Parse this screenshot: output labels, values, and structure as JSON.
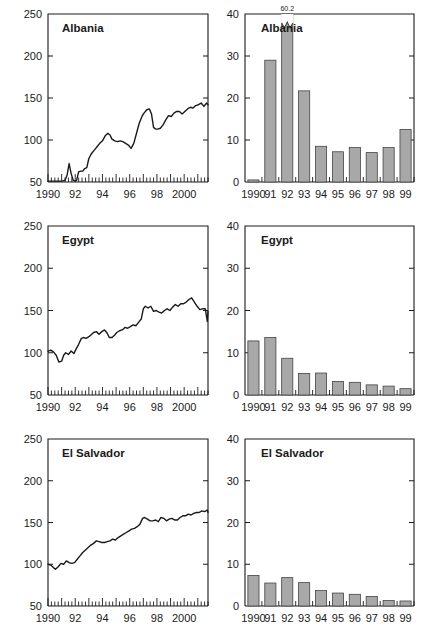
{
  "figure": {
    "panel_count": 6,
    "background": "#ffffff",
    "ink_color": "#1a1a1a",
    "bar_fill": "#a8a8a8",
    "bar_stroke": "#444444"
  },
  "chart_data": [
    {
      "id": "albania-line",
      "type": "line",
      "title": "Albania",
      "xlabel": "",
      "ylabel": "",
      "ylim": [
        50,
        250
      ],
      "yticks": [
        50,
        100,
        150,
        200,
        250
      ],
      "ytick_labels": [
        "50",
        "100",
        "150",
        "200",
        "250"
      ],
      "xlim": [
        1990.0,
        2001.75
      ],
      "xticks": [
        1990,
        1992,
        1994,
        1996,
        1998,
        2000
      ],
      "xtick_labels": [
        "1990",
        "92",
        "94",
        "96",
        "98",
        "2000"
      ],
      "minor_tick_interval": 0.25,
      "grid": false,
      "legend": "none",
      "x": [
        1990.0,
        1990.25,
        1990.5,
        1990.75,
        1991.0,
        1991.25,
        1991.4,
        1991.55,
        1991.7,
        1991.85,
        1992.0,
        1992.1,
        1992.25,
        1992.4,
        1992.55,
        1992.7,
        1992.85,
        1993.0,
        1993.2,
        1993.4,
        1993.6,
        1993.8,
        1994.0,
        1994.2,
        1994.4,
        1994.55,
        1994.7,
        1994.9,
        1995.1,
        1995.3,
        1995.5,
        1995.7,
        1995.9,
        1996.1,
        1996.3,
        1996.5,
        1996.7,
        1996.9,
        1997.05,
        1997.25,
        1997.45,
        1997.6,
        1997.75,
        1997.9,
        1998.05,
        1998.25,
        1998.45,
        1998.65,
        1998.85,
        1999.05,
        1999.25,
        1999.45,
        1999.65,
        1999.85,
        2000.05,
        2000.25,
        2000.45,
        2000.65,
        2000.85,
        2001.05,
        2001.25,
        2001.45,
        2001.65,
        2001.75
      ],
      "y": [
        51,
        51,
        51,
        51,
        51,
        52,
        58,
        72,
        60,
        52,
        51,
        52,
        62,
        63,
        63,
        66,
        67,
        78,
        84,
        88,
        92,
        96,
        99,
        105,
        108,
        106,
        101,
        99,
        98,
        99,
        98,
        96,
        94,
        90,
        96,
        108,
        120,
        128,
        132,
        136,
        137,
        131,
        115,
        113,
        113,
        114,
        118,
        124,
        129,
        128,
        132,
        134,
        134,
        131,
        134,
        137,
        139,
        138,
        141,
        142,
        144,
        140,
        144,
        142
      ]
    },
    {
      "id": "albania-bar",
      "type": "bar",
      "title": "Albania",
      "xlabel": "",
      "ylabel": "",
      "ylim": [
        0,
        40
      ],
      "yticks": [
        0,
        10,
        20,
        30,
        40
      ],
      "ytick_labels": [
        "0",
        "10",
        "20",
        "30",
        "40"
      ],
      "categories": [
        "1990",
        "91",
        "92",
        "93",
        "94",
        "95",
        "96",
        "97",
        "98",
        "99"
      ],
      "values": [
        0.5,
        29.0,
        60.2,
        21.7,
        8.5,
        7.2,
        8.2,
        7.0,
        8.2,
        12.5
      ],
      "clipped_bars": [
        {
          "category": "92",
          "value": 60.2,
          "label": "60.2",
          "axis_max": 40,
          "break_marker": true
        }
      ],
      "grid": false,
      "legend": "none"
    },
    {
      "id": "egypt-line",
      "type": "line",
      "title": "Egypt",
      "xlabel": "",
      "ylabel": "",
      "ylim": [
        50,
        250
      ],
      "yticks": [
        50,
        100,
        150,
        200,
        250
      ],
      "ytick_labels": [
        "50",
        "100",
        "150",
        "200",
        "250"
      ],
      "xlim": [
        1990.0,
        2001.75
      ],
      "xticks": [
        1990,
        1992,
        1994,
        1996,
        1998,
        2000
      ],
      "xtick_labels": [
        "1990",
        "92",
        "94",
        "96",
        "98",
        "2000"
      ],
      "minor_tick_interval": 0.25,
      "grid": false,
      "legend": "none",
      "x": [
        1990.0,
        1990.2,
        1990.4,
        1990.6,
        1990.8,
        1991.0,
        1991.15,
        1991.3,
        1991.5,
        1991.7,
        1991.9,
        1992.05,
        1992.25,
        1992.45,
        1992.6,
        1992.8,
        1993.0,
        1993.15,
        1993.35,
        1993.55,
        1993.75,
        1993.95,
        1994.15,
        1994.35,
        1994.5,
        1994.7,
        1994.9,
        1995.05,
        1995.25,
        1995.45,
        1995.65,
        1995.85,
        1996.05,
        1996.25,
        1996.45,
        1996.65,
        1996.85,
        1997.0,
        1997.15,
        1997.35,
        1997.55,
        1997.75,
        1997.95,
        1998.15,
        1998.35,
        1998.55,
        1998.75,
        1998.95,
        1999.15,
        1999.35,
        1999.55,
        1999.75,
        1999.95,
        2000.15,
        2000.35,
        2000.55,
        2000.75,
        2000.95,
        2001.15,
        2001.35,
        2001.55,
        2001.7,
        2001.75
      ],
      "y": [
        102,
        103,
        101,
        97,
        89,
        90,
        97,
        100,
        98,
        102,
        99,
        104,
        110,
        117,
        118,
        117,
        119,
        121,
        124,
        125,
        122,
        125,
        127,
        123,
        118,
        118,
        121,
        124,
        126,
        127,
        130,
        129,
        131,
        133,
        132,
        136,
        140,
        152,
        155,
        153,
        155,
        149,
        150,
        148,
        147,
        150,
        152,
        150,
        154,
        157,
        155,
        158,
        158,
        160,
        163,
        165,
        160,
        155,
        151,
        152,
        152,
        137,
        149
      ]
    },
    {
      "id": "egypt-bar",
      "type": "bar",
      "title": "Egypt",
      "xlabel": "",
      "ylabel": "",
      "ylim": [
        0,
        40
      ],
      "yticks": [
        0,
        10,
        20,
        30,
        40
      ],
      "ytick_labels": [
        "0",
        "10",
        "20",
        "30",
        "40"
      ],
      "categories": [
        "1990",
        "91",
        "92",
        "93",
        "94",
        "95",
        "96",
        "97",
        "98",
        "99"
      ],
      "values": [
        12.8,
        13.6,
        8.7,
        5.1,
        5.2,
        3.2,
        3.0,
        2.4,
        2.1,
        1.5
      ],
      "clipped_bars": [],
      "grid": false,
      "legend": "none"
    },
    {
      "id": "elsalvador-line",
      "type": "line",
      "title": "El Salvador",
      "xlabel": "",
      "ylabel": "",
      "ylim": [
        50,
        250
      ],
      "yticks": [
        50,
        100,
        150,
        200,
        250
      ],
      "ytick_labels": [
        "50",
        "100",
        "150",
        "200",
        "250"
      ],
      "xlim": [
        1990.0,
        2001.75
      ],
      "xticks": [
        1990,
        1992,
        1994,
        1996,
        1998,
        2000
      ],
      "xtick_labels": [
        "1990",
        "92",
        "94",
        "96",
        "98",
        "2000"
      ],
      "minor_tick_interval": 0.25,
      "grid": false,
      "legend": "none",
      "x": [
        1990.0,
        1990.2,
        1990.4,
        1990.55,
        1990.75,
        1990.95,
        1991.15,
        1991.35,
        1991.55,
        1991.75,
        1991.95,
        1992.15,
        1992.35,
        1992.55,
        1992.75,
        1992.95,
        1993.15,
        1993.35,
        1993.55,
        1993.75,
        1993.95,
        1994.15,
        1994.35,
        1994.55,
        1994.75,
        1994.95,
        1995.15,
        1995.35,
        1995.55,
        1995.75,
        1995.95,
        1996.15,
        1996.35,
        1996.55,
        1996.75,
        1996.95,
        1997.1,
        1997.3,
        1997.5,
        1997.7,
        1997.9,
        1998.1,
        1998.3,
        1998.5,
        1998.7,
        1998.9,
        1999.1,
        1999.3,
        1999.5,
        1999.7,
        1999.9,
        2000.1,
        2000.3,
        2000.5,
        2000.7,
        2000.9,
        2001.1,
        2001.3,
        2001.5,
        2001.7,
        2001.75
      ],
      "y": [
        100,
        99,
        96,
        94,
        97,
        101,
        100,
        104,
        102,
        101,
        102,
        106,
        110,
        114,
        117,
        120,
        123,
        125,
        128,
        127,
        126,
        126,
        127,
        128,
        130,
        129,
        132,
        134,
        136,
        138,
        140,
        142,
        143,
        145,
        148,
        155,
        156,
        154,
        152,
        152,
        153,
        151,
        156,
        155,
        152,
        154,
        155,
        153,
        153,
        156,
        158,
        158,
        160,
        159,
        161,
        162,
        162,
        164,
        163,
        165,
        162
      ]
    },
    {
      "id": "elsalvador-bar",
      "type": "bar",
      "title": "El Salvador",
      "xlabel": "",
      "ylabel": "",
      "ylim": [
        0,
        40
      ],
      "yticks": [
        0,
        10,
        20,
        30,
        40
      ],
      "ytick_labels": [
        "0",
        "10",
        "20",
        "30",
        "40"
      ],
      "categories": [
        "1990",
        "91",
        "92",
        "93",
        "94",
        "95",
        "96",
        "97",
        "98",
        "99"
      ],
      "values": [
        7.3,
        5.5,
        6.8,
        5.6,
        3.7,
        3.1,
        2.8,
        2.3,
        1.3,
        1.2
      ],
      "clipped_bars": [],
      "grid": false,
      "legend": "none"
    }
  ]
}
